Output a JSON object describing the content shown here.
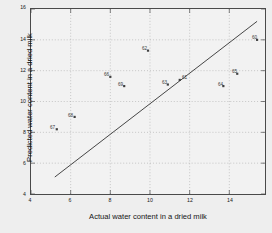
{
  "chart_data": {
    "type": "scatter",
    "title": "",
    "xlabel": "Actual water content in a dried milk",
    "ylabel": "Predicted water content in a dried milk",
    "xlim": [
      4,
      15.8
    ],
    "ylim": [
      4,
      16
    ],
    "xticks": [
      4,
      6,
      8,
      10,
      12,
      14
    ],
    "yticks": [
      4,
      6,
      8,
      10,
      12,
      14,
      16
    ],
    "xtick_labels": [
      "4",
      "6",
      "8",
      "10",
      "12",
      "14"
    ],
    "ytick_labels": [
      "4",
      "6",
      "8",
      "10",
      "12",
      "14",
      "16"
    ],
    "grid": true,
    "grid_style": "dotted",
    "marker": "point",
    "marker_color": "#404040",
    "line_color": "#303030",
    "background_color": "#f2f2f2",
    "figure_color": "#eeeeee",
    "reference_line": {
      "name": "identity-line",
      "x": [
        5.2,
        15.4
      ],
      "y": [
        5.1,
        15.2
      ]
    },
    "points": [
      {
        "label": "67",
        "x": 5.3,
        "y": 8.2,
        "label_dx": -6,
        "label_dy": -1
      },
      {
        "label": "68",
        "x": 6.2,
        "y": 9.0,
        "label_dx": -6,
        "label_dy": -1
      },
      {
        "label": "66",
        "x": 8.0,
        "y": 11.6,
        "label_dx": -6,
        "label_dy": -1
      },
      {
        "label": "69",
        "x": 8.7,
        "y": 11.0,
        "label_dx": -6,
        "label_dy": -1
      },
      {
        "label": "62",
        "x": 9.9,
        "y": 13.3,
        "label_dx": -6,
        "label_dy": -1
      },
      {
        "label": "63",
        "x": 10.9,
        "y": 11.1,
        "label_dx": -6,
        "label_dy": -1
      },
      {
        "label": "61",
        "x": 11.5,
        "y": 11.4,
        "label_dx": 2,
        "label_dy": -1
      },
      {
        "label": "64",
        "x": 13.7,
        "y": 11.0,
        "label_dx": -6,
        "label_dy": -1
      },
      {
        "label": "65",
        "x": 14.4,
        "y": 11.8,
        "label_dx": -6,
        "label_dy": -1
      },
      {
        "label": "60",
        "x": 15.4,
        "y": 14.0,
        "label_dx": -6,
        "label_dy": -1
      }
    ]
  }
}
